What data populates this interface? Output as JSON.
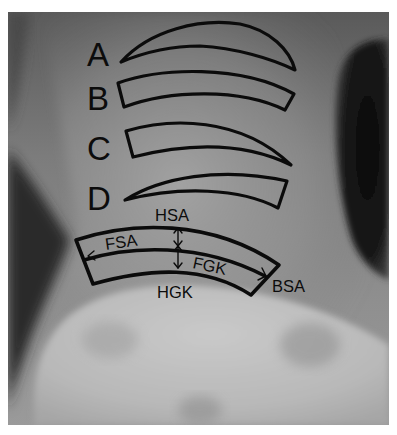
{
  "figure": {
    "colors": {
      "background_page": "#ffffff",
      "xray_mid_gray": "#8a8a8a",
      "xray_light": "#c8c8c8",
      "xray_dark": "#141414",
      "outline": "#0b0b0b"
    }
  },
  "variants": [
    {
      "id": "A",
      "label": "A",
      "shape": "crescent (pointed both ends)"
    },
    {
      "id": "B",
      "label": "B",
      "shape": "curved band, squared both ends"
    },
    {
      "id": "C",
      "label": "C",
      "shape": "curved band, squared left end, pointed right end"
    },
    {
      "id": "D",
      "label": "D",
      "shape": "curved band, pointed left end, squared right end"
    }
  ],
  "band_labels": {
    "top": "HSA",
    "upper_layer": "FSA",
    "lower_layer": "FGK",
    "bottom": "HGK",
    "right": "BSA"
  }
}
